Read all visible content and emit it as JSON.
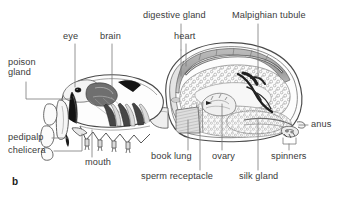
{
  "figure": {
    "letter": "b",
    "colors": {
      "ink": "#3a3a3a",
      "outline": "#4a4a4a",
      "leader": "#6d6d6d",
      "fill_light": "#f2f2f2",
      "fill_mid": "#c9c9c9",
      "fill_dark": "#7d7d7d",
      "fill_black": "#1b1b1b",
      "background": "#ffffff"
    }
  },
  "labels": [
    {
      "id": "poison-gland",
      "text": "poison\ngland",
      "line1": "poison",
      "line2": "gland",
      "x": 8,
      "y": 58,
      "align": "left"
    },
    {
      "id": "eye",
      "text": "eye",
      "x": 63,
      "y": 32,
      "align": "left"
    },
    {
      "id": "brain",
      "text": "brain",
      "x": 100,
      "y": 32,
      "align": "left"
    },
    {
      "id": "digestive-gland",
      "text": "digestive gland",
      "x": 143,
      "y": 11,
      "align": "left"
    },
    {
      "id": "heart",
      "text": "heart",
      "x": 174,
      "y": 32,
      "align": "left"
    },
    {
      "id": "malpighian-tubule",
      "text": "Malpighian tubule",
      "x": 233,
      "y": 11,
      "align": "left"
    },
    {
      "id": "anus",
      "text": "anus",
      "x": 310,
      "y": 120,
      "align": "left"
    },
    {
      "id": "spinners",
      "text": "spinners",
      "x": 272,
      "y": 152,
      "align": "left"
    },
    {
      "id": "silk-gland",
      "text": "silk gland",
      "x": 240,
      "y": 172,
      "align": "left"
    },
    {
      "id": "ovary",
      "text": "ovary",
      "x": 213,
      "y": 152,
      "align": "left"
    },
    {
      "id": "sperm-receptacle",
      "text": "sperm receptacle",
      "x": 142,
      "y": 172,
      "align": "left"
    },
    {
      "id": "book-lung",
      "text": "book lung",
      "x": 152,
      "y": 152,
      "align": "left"
    },
    {
      "id": "mouth",
      "text": "mouth",
      "x": 85,
      "y": 158,
      "align": "left"
    },
    {
      "id": "chelicera",
      "text": "chelicera",
      "x": 8,
      "y": 146,
      "align": "left"
    },
    {
      "id": "pedipalp",
      "text": "pedipalp",
      "x": 8,
      "y": 133,
      "align": "left"
    }
  ],
  "structures": [
    "poison gland",
    "eye",
    "brain",
    "digestive gland",
    "heart",
    "Malpighian tubule",
    "anus",
    "spinners",
    "silk gland",
    "ovary",
    "sperm receptacle",
    "book lung",
    "mouth",
    "chelicera",
    "pedipalp"
  ]
}
